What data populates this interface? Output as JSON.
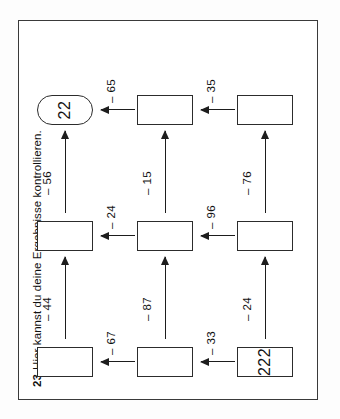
{
  "worksheet": {
    "exercise_number": "23",
    "instruction": "Hier kannst du deine Ergebnisse kontrollieren.",
    "colors": {
      "ink": "#1d1d1d",
      "frame": "#3a3a3a",
      "paper": "#ffffff"
    }
  },
  "flow": {
    "start_value": "222",
    "result_value": "22",
    "boxes": [
      {
        "id": "b1",
        "row": 1,
        "col": 1,
        "value": "222",
        "shape": "rect"
      },
      {
        "id": "b2",
        "row": 1,
        "col": 2,
        "value": "",
        "shape": "rect"
      },
      {
        "id": "b3",
        "row": 1,
        "col": 3,
        "value": "",
        "shape": "rect"
      },
      {
        "id": "b4",
        "row": 2,
        "col": 1,
        "value": "",
        "shape": "rect"
      },
      {
        "id": "b5",
        "row": 2,
        "col": 2,
        "value": "",
        "shape": "rect"
      },
      {
        "id": "b6",
        "row": 2,
        "col": 3,
        "value": "",
        "shape": "rect"
      },
      {
        "id": "b7",
        "row": 3,
        "col": 1,
        "value": "",
        "shape": "rect"
      },
      {
        "id": "b8",
        "row": 3,
        "col": 2,
        "value": "",
        "shape": "rect"
      },
      {
        "id": "b9",
        "row": 3,
        "col": 3,
        "value": "22",
        "shape": "rounded"
      }
    ],
    "operations": {
      "row_bottom": [
        "– 24",
        "– 76"
      ],
      "row_middle": [
        "– 87",
        "– 15"
      ],
      "row_top": [
        "– 44",
        "– 56"
      ],
      "col_left": [
        "– 33",
        "– 67"
      ],
      "col_middle": [
        "– 96",
        "– 24"
      ],
      "col_right": [
        "– 35",
        "– 65"
      ]
    },
    "labels": {
      "a_bottom_1": "– 24",
      "a_bottom_2": "– 76",
      "a_up_left": "– 33",
      "a_up_mid": "– 96",
      "a_up_right": "– 35",
      "a_middle_1": "– 87",
      "a_middle_2": "– 15",
      "a_up2_left": "– 67",
      "a_up2_mid": "– 24",
      "a_up2_right": "– 65",
      "a_top_1": "– 44",
      "a_top_2": "– 56"
    }
  }
}
